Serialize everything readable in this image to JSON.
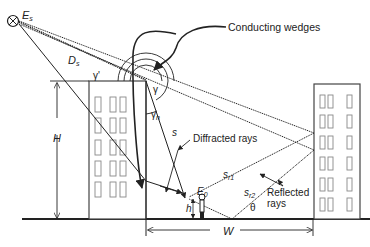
{
  "diagram": {
    "title": "",
    "labels": {
      "source": "E",
      "source_sub": "s",
      "distance_source": "D",
      "distance_source_sub": "s",
      "gamma_prime": "γ'",
      "gamma": "γ",
      "gamma_n": "γ",
      "gamma_n_sub": "n",
      "height_building": "H",
      "height_receiver": "h",
      "receiver": "E",
      "receiver_sub": "0",
      "diffracted_path": "s",
      "reflected_path_1": "s",
      "reflected_path_1_sub": "r1",
      "reflected_path_2": "s",
      "reflected_path_2_sub": "r2",
      "theta": "θ",
      "street_width": "W"
    },
    "callouts": {
      "conducting_wedges": "Conducting wedges",
      "diffracted_rays": "Diffracted rays",
      "reflected_rays_line1": "Reflected",
      "reflected_rays_line2": "rays"
    },
    "colors": {
      "line": "#222222",
      "building_fill": "#ffffff",
      "window_stroke": "#777777"
    }
  }
}
